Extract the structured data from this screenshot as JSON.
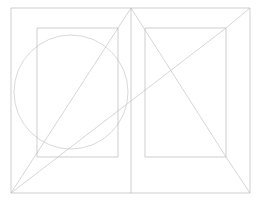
{
  "document": {
    "title": "Canon of Page Construction Diagram",
    "kind": "geometric-line-diagram",
    "background_color": "#ffffff",
    "width": 261,
    "height": 202
  },
  "style": {
    "stroke_color_primary": "#b9b9b9",
    "stroke_color_secondary": "#c4c4c4",
    "stroke_color_light": "#cfcfcf",
    "stroke_width": 0.7,
    "fill": "none"
  },
  "geometry": {
    "spread": {
      "name": "outer-spread-rectangle",
      "x": 11,
      "y": 8,
      "width": 239,
      "height": 185,
      "left": 11,
      "top": 8,
      "right": 250,
      "bottom": 193
    },
    "gutter": {
      "name": "center-gutter-line",
      "x": 131,
      "y1": 8,
      "y2": 193
    },
    "left_page": {
      "left": 11,
      "top": 8,
      "right": 131,
      "bottom": 193
    },
    "right_page": {
      "left": 131,
      "top": 8,
      "right": 250,
      "bottom": 193
    },
    "left_text_block": {
      "name": "left-inner-rectangle",
      "x": 37,
      "y": 28,
      "width": 81,
      "height": 129,
      "left": 37,
      "top": 28,
      "right": 118,
      "bottom": 157
    },
    "right_text_block": {
      "name": "right-inner-rectangle",
      "x": 145,
      "y": 28,
      "width": 81,
      "height": 129,
      "left": 145,
      "top": 28,
      "right": 226,
      "bottom": 157
    },
    "circle": {
      "name": "left-page-circle",
      "cx": 71,
      "cy": 92,
      "r": 57
    },
    "diagonals": [
      {
        "name": "diagonal-bottomleft-to-topcenter",
        "x1": 11,
        "y1": 193,
        "x2": 131,
        "y2": 8
      },
      {
        "name": "diagonal-bottomleft-to-rightinner-topright",
        "x1": 11,
        "y1": 193,
        "x2": 226,
        "y2": 28
      },
      {
        "name": "diagonal-topcenter-to-rightinner-bottomright",
        "x1": 131,
        "y1": 8,
        "x2": 226,
        "y2": 157
      },
      {
        "name": "diagonal-topright-to-bottomright-corner",
        "x1": 250,
        "y1": 8,
        "x2": 226,
        "y2": 28
      },
      {
        "name": "diagonal-rightpage-bottomright-tail",
        "x1": 226,
        "y1": 157,
        "x2": 250,
        "y2": 193
      }
    ]
  },
  "chart_data": {
    "type": "diagram",
    "subtitle": "",
    "elements": [
      {
        "shape": "rectangle",
        "role": "page-spread-trim",
        "points": [
          [
            11,
            8
          ],
          [
            250,
            8
          ],
          [
            250,
            193
          ],
          [
            11,
            193
          ]
        ]
      },
      {
        "shape": "line",
        "role": "gutter",
        "points": [
          [
            131,
            8
          ],
          [
            131,
            193
          ]
        ]
      },
      {
        "shape": "rectangle",
        "role": "text-block-verso",
        "points": [
          [
            37,
            28
          ],
          [
            118,
            28
          ],
          [
            118,
            157
          ],
          [
            37,
            157
          ]
        ]
      },
      {
        "shape": "rectangle",
        "role": "text-block-recto",
        "points": [
          [
            145,
            28
          ],
          [
            226,
            28
          ],
          [
            226,
            157
          ],
          [
            145,
            157
          ]
        ]
      },
      {
        "shape": "circle",
        "role": "construction-circle",
        "center": [
          71,
          92
        ],
        "radius": 57
      },
      {
        "shape": "line",
        "role": "construction-diagonal",
        "points": [
          [
            11,
            193
          ],
          [
            131,
            8
          ]
        ]
      },
      {
        "shape": "line",
        "role": "construction-diagonal",
        "points": [
          [
            11,
            193
          ],
          [
            226,
            28
          ]
        ]
      },
      {
        "shape": "line",
        "role": "construction-diagonal",
        "points": [
          [
            131,
            8
          ],
          [
            226,
            157
          ]
        ]
      },
      {
        "shape": "line",
        "role": "construction-diagonal",
        "points": [
          [
            250,
            8
          ],
          [
            226,
            28
          ]
        ]
      },
      {
        "shape": "line",
        "role": "construction-diagonal",
        "points": [
          [
            226,
            157
          ],
          [
            250,
            193
          ]
        ]
      }
    ],
    "xlabel": "",
    "ylabel": "",
    "legend": [],
    "annotations": [],
    "grid": false
  }
}
